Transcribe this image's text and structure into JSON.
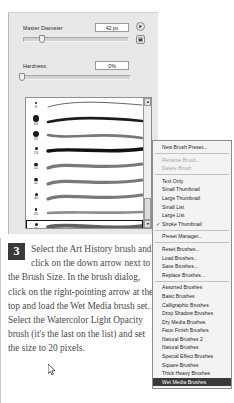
{
  "panel": {
    "master_diameter": {
      "label": "Master Diameter",
      "value": "42 px"
    },
    "hardness": {
      "label": "Hardness:",
      "value": "0%"
    },
    "arrow_right_icon": "right-pointing-arrow-icon",
    "arrow_menu_icon": "panel-menu-icon",
    "scroll_up_icon": "scroll-up-arrow-icon",
    "scroll_down_icon": "scroll-down-arrow-icon"
  },
  "brushes": [
    {
      "size": "8",
      "dot": 2.2,
      "type": "thin-wisp",
      "selected": false
    },
    {
      "size": "63",
      "dot": 6.5,
      "type": "tapered",
      "selected": false
    },
    {
      "size": "41",
      "dot": 6.0,
      "type": "speckled",
      "selected": false
    },
    {
      "size": "23",
      "dot": 3.0,
      "type": "solid-bold",
      "selected": false
    },
    {
      "size": "42",
      "dot": 3.2,
      "type": "soft-wave",
      "selected": false
    },
    {
      "size": "42",
      "dot": 3.2,
      "type": "soft-wave",
      "selected": false
    },
    {
      "size": "40",
      "dot": 3.0,
      "type": "soft-wave",
      "selected": false
    },
    {
      "size": "45",
      "dot": 2.8,
      "type": "flat-dry",
      "selected": false
    },
    {
      "size": "43",
      "dot": 3.0,
      "type": "watercolor",
      "selected": true
    }
  ],
  "menu": {
    "groups": [
      [
        {
          "label": "New Brush Preset...",
          "state": "normal"
        }
      ],
      [
        {
          "label": "Rename Brush...",
          "state": "disabled"
        },
        {
          "label": "Delete Brush",
          "state": "disabled"
        }
      ],
      [
        {
          "label": "Text Only",
          "state": "normal"
        },
        {
          "label": "Small Thumbnail",
          "state": "normal"
        },
        {
          "label": "Large Thumbnail",
          "state": "normal"
        },
        {
          "label": "Small List",
          "state": "normal"
        },
        {
          "label": "Large List",
          "state": "normal"
        },
        {
          "label": "Stroke Thumbnail",
          "state": "checked"
        }
      ],
      [
        {
          "label": "Preset Manager...",
          "state": "normal"
        }
      ],
      [
        {
          "label": "Reset Brushes...",
          "state": "normal"
        },
        {
          "label": "Load Brushes...",
          "state": "normal"
        },
        {
          "label": "Save Brushes...",
          "state": "normal"
        },
        {
          "label": "Replace Brushes...",
          "state": "normal"
        }
      ],
      [
        {
          "label": "Assorted Brushes",
          "state": "normal"
        },
        {
          "label": "Basic Brushes",
          "state": "normal"
        },
        {
          "label": "Calligraphic Brushes",
          "state": "normal"
        },
        {
          "label": "Drop Shadow Brushes",
          "state": "normal"
        },
        {
          "label": "Dry Media Brushes",
          "state": "normal"
        },
        {
          "label": "Faux Finish Brushes",
          "state": "normal"
        },
        {
          "label": "Natural Brushes 2",
          "state": "normal"
        },
        {
          "label": "Natural Brushes",
          "state": "normal"
        },
        {
          "label": "Special Effect Brushes",
          "state": "normal"
        },
        {
          "label": "Square Brushes",
          "state": "normal"
        },
        {
          "label": "Thick Heavy Brushes",
          "state": "normal"
        },
        {
          "label": "Wet Media Brushes",
          "state": "selected"
        }
      ]
    ],
    "check_glyph": "✓"
  },
  "instruction": {
    "step_number": "3",
    "text": "Select the Art History brush and click on the down arrow next to the Brush Size. In the brush dialog, click on the right-pointing arrow at the top and load the Wet Media brush set. Select the Watercolor Light Opacity brush (it's the last on the list) and set the size to 20 pixels."
  }
}
